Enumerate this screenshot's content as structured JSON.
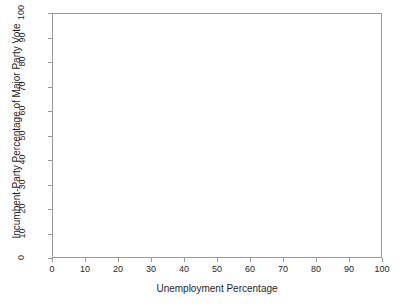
{
  "chart_data": {
    "type": "scatter",
    "title": "",
    "subtitle": "",
    "xlabel": "Unemployment Percentage",
    "ylabel": "Incumbent-Party Percentage of Major Party Vote",
    "xlim": [
      0,
      100
    ],
    "ylim": [
      0,
      100
    ],
    "xticks": [
      0,
      10,
      20,
      30,
      40,
      50,
      60,
      70,
      80,
      90,
      100
    ],
    "yticks": [
      0,
      10,
      20,
      30,
      40,
      50,
      60,
      70,
      80,
      90,
      100
    ],
    "xticklabels": [
      "0",
      "10",
      "20",
      "30",
      "40",
      "50",
      "60",
      "70",
      "80",
      "90",
      "100"
    ],
    "yticklabels": [
      "0",
      "10",
      "20",
      "30",
      "40",
      "50",
      "60",
      "70",
      "80",
      "90",
      "100"
    ],
    "grid": false,
    "legend": null,
    "legend_position": "none",
    "annotations": [],
    "series": [
      {
        "name": "",
        "x": [],
        "y": []
      }
    ],
    "colors": {
      "background": "#ffffff",
      "axis_line": "#9a9a9a",
      "tick_mark": "#9a9a9a",
      "tick_label": "#262626",
      "axis_title": "#1f1f1f"
    }
  }
}
